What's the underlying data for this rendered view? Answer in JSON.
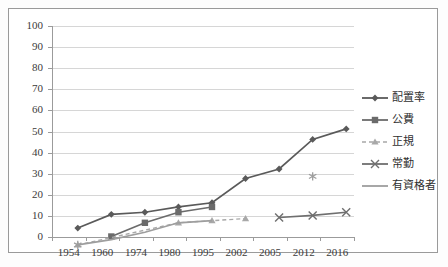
{
  "title_sliver": "",
  "chart_data": {
    "type": "line",
    "title": "",
    "subtitle": "",
    "xlabel": "",
    "ylabel": "",
    "categories": [
      "1954",
      "1960",
      "1974",
      "1980",
      "1995",
      "2002",
      "2005",
      "2012",
      "2016"
    ],
    "ylim": [
      0,
      100
    ],
    "ytick_step": 10,
    "yticks": [
      "100",
      "90",
      "80",
      "70",
      "60",
      "50",
      "40",
      "30",
      "20",
      "10",
      "0"
    ],
    "grid": true,
    "legend_position": "right",
    "series": [
      {
        "name": "配置率",
        "marker": "diamond",
        "line": "solid",
        "color": "#5a5a5a",
        "x": [
          "1954",
          "1960",
          "1974",
          "1980",
          "1995",
          "2002",
          "2005",
          "2012",
          "2016"
        ],
        "values": [
          8.5,
          15.0,
          16.0,
          18.5,
          20.5,
          32.0,
          36.5,
          50.5,
          55.5
        ]
      },
      {
        "name": "公費",
        "marker": "square",
        "line": "solid",
        "color": "#6b6b6b",
        "x": [
          "1960",
          "1974",
          "1980",
          "1995"
        ],
        "values": [
          4.5,
          11.0,
          16.0,
          18.5
        ]
      },
      {
        "name": "正規",
        "marker": "triangle",
        "line": "dashed",
        "color": "#a8a8a8",
        "x": [
          "1954",
          "1980",
          "1995",
          "2002"
        ],
        "values": [
          0.5,
          11.0,
          12.0,
          13.0
        ]
      },
      {
        "name": "常勤",
        "marker": "cross",
        "line": "solid",
        "color": "#6f6f6f",
        "x": [
          "2005",
          "2012",
          "2016"
        ],
        "values": [
          13.5,
          14.5,
          16.0
        ]
      },
      {
        "name": "有資格者",
        "marker": "asterisk",
        "line": "solid",
        "color": "#9e9e9e",
        "x": [
          "1954",
          "1960",
          "1974",
          "1980",
          "1995",
          "2012"
        ],
        "values": [
          0.5,
          3.0,
          6.5,
          11.0,
          12.0,
          33.0
        ]
      }
    ]
  },
  "legend": {
    "items": [
      {
        "label": "配置率"
      },
      {
        "label": "公費"
      },
      {
        "label": "正規"
      },
      {
        "label": "常勤"
      },
      {
        "label": "有資格者"
      }
    ]
  },
  "colors": {
    "grid": "#d6d6d6",
    "axis": "#9b9b9b",
    "frame": "#9a9a9a",
    "text": "#3b3b3b",
    "background": "#ffffff"
  }
}
